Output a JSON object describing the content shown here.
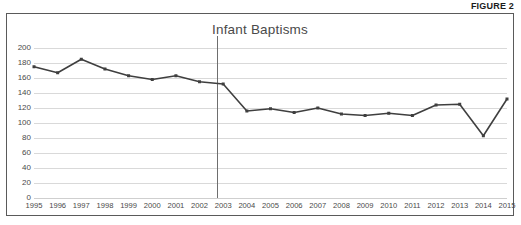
{
  "figure": {
    "caption": "FIGURE 2"
  },
  "chart_data": {
    "type": "line",
    "title": "Infant Baptisms",
    "xlabel": "",
    "ylabel": "",
    "categories": [
      "1995",
      "1996",
      "1997",
      "1998",
      "1999",
      "2000",
      "2001",
      "2002",
      "2003",
      "2004",
      "2005",
      "2006",
      "2007",
      "2008",
      "2009",
      "2010",
      "2011",
      "2012",
      "2013",
      "2014",
      "2015"
    ],
    "values": [
      175,
      167,
      185,
      172,
      163,
      158,
      163,
      155,
      152,
      116,
      119,
      114,
      120,
      112,
      110,
      113,
      110,
      124,
      125,
      83,
      132
    ],
    "series": [
      {
        "name": "Infant Baptisms",
        "values": [
          175,
          167,
          185,
          172,
          163,
          158,
          163,
          155,
          152,
          116,
          119,
          114,
          120,
          112,
          110,
          113,
          110,
          124,
          125,
          83,
          132
        ]
      }
    ],
    "ylim": [
      0,
      200
    ],
    "yticks": [
      0,
      20,
      40,
      60,
      80,
      100,
      120,
      140,
      160,
      180,
      200
    ],
    "ytick_labels": [
      "0",
      "20",
      "40",
      "60",
      "80",
      "100",
      "120",
      "140",
      "160",
      "180",
      "200"
    ],
    "grid": true,
    "legend": false,
    "legend_position": "none",
    "marker": "square",
    "line_color": "#3f3f3f",
    "grid_color": "#d9d9d9",
    "annotations": [
      {
        "name": "reference-line",
        "type": "vertical-line",
        "between": [
          "2002",
          "2003"
        ],
        "at_category_index": 7.72,
        "color": "#6e6e6e"
      }
    ]
  }
}
